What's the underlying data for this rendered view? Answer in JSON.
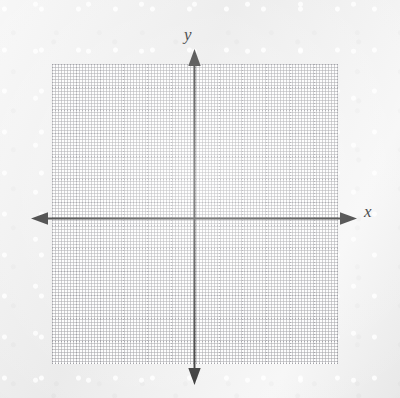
{
  "figure": {
    "kind": "blank-cartesian-coordinate-plane",
    "background_color": "#ededed",
    "grid_panel_color": "#fdfdfd",
    "axis_color": "#2b2b2b",
    "grid_color": "#8c8c94"
  },
  "axes": {
    "x": {
      "label": "x",
      "arrow_left": true,
      "arrow_right": true
    },
    "y": {
      "label": "y",
      "arrow_up": true,
      "arrow_down": true
    },
    "origin_label": ""
  },
  "chart_data": {
    "type": "scatter",
    "title": "",
    "subtitle": "",
    "xlabel": "x",
    "ylabel": "y",
    "xlim": [
      -6,
      6
    ],
    "ylim": [
      -6,
      6.5
    ],
    "xticks": [
      -6,
      -5,
      -4,
      -3,
      -2,
      -1,
      0,
      1,
      2,
      3,
      4,
      5,
      6
    ],
    "yticks": [
      -6,
      -5,
      -4,
      -3,
      -2,
      -1,
      0,
      1,
      2,
      3,
      4,
      5,
      6
    ],
    "xtick_labels": [
      "",
      "",
      "",
      "",
      "",
      "",
      "",
      "",
      "",
      "",
      "",
      "",
      ""
    ],
    "ytick_labels": [
      "",
      "",
      "",
      "",
      "",
      "",
      "",
      "",
      "",
      "",
      "",
      "",
      ""
    ],
    "grid": true,
    "grid_style": "dotted",
    "grid_columns": 12,
    "grid_rows": 13,
    "legend": false,
    "legend_position": "none",
    "series": [],
    "x": [],
    "values": [],
    "annotations": []
  },
  "grid": {
    "columns": 12,
    "rows": 13,
    "cell_width_px": 23.8,
    "cell_height_px": 23.05
  }
}
